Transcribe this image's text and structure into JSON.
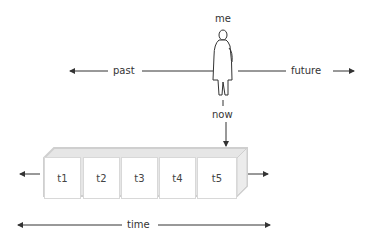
{
  "labels": {
    "me": "me",
    "past": "past",
    "future": "future",
    "now": "now",
    "time": "time"
  },
  "timeline_boxes": [
    {
      "label": "t1"
    },
    {
      "label": "t2"
    },
    {
      "label": "t3"
    },
    {
      "label": "t4"
    },
    {
      "label": "t5"
    }
  ],
  "colors": {
    "line": "#333333",
    "box_shadow": "#d0d0d0",
    "box_face": "#ffffff"
  }
}
